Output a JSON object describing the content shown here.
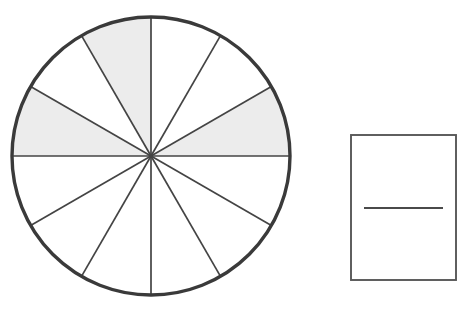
{
  "diagram": {
    "background_color": "#ffffff"
  },
  "chart_data": {
    "type": "pie",
    "title": "",
    "subtitle": "",
    "xlabel": "",
    "ylabel": "",
    "legend_position": "none",
    "grid": false,
    "total_sectors": 12,
    "sector_angle_degrees": 30,
    "shaded_count": 3,
    "unshaded_count": 9,
    "fraction_shaded": "3/12",
    "categories": [
      "0-30",
      "30-60",
      "60-90",
      "90-120",
      "120-150",
      "150-180",
      "180-210",
      "210-240",
      "240-270",
      "270-300",
      "300-330",
      "330-360"
    ],
    "values": [
      30,
      30,
      30,
      30,
      30,
      30,
      30,
      30,
      30,
      30,
      30,
      30
    ],
    "series": [
      {
        "name": "shaded",
        "values": [
          1,
          0,
          0,
          1,
          0,
          1,
          0,
          0,
          0,
          0,
          0,
          0
        ]
      }
    ],
    "shaded_sectors": [
      {
        "index": 0,
        "start_deg": 0,
        "end_deg": 30,
        "shaded": true
      },
      {
        "index": 1,
        "start_deg": 30,
        "end_deg": 60,
        "shaded": false
      },
      {
        "index": 2,
        "start_deg": 60,
        "end_deg": 90,
        "shaded": false
      },
      {
        "index": 3,
        "start_deg": 90,
        "end_deg": 120,
        "shaded": true
      },
      {
        "index": 4,
        "start_deg": 120,
        "end_deg": 150,
        "shaded": false
      },
      {
        "index": 5,
        "start_deg": 150,
        "end_deg": 180,
        "shaded": true
      },
      {
        "index": 6,
        "start_deg": 180,
        "end_deg": 210,
        "shaded": false
      },
      {
        "index": 7,
        "start_deg": 210,
        "end_deg": 240,
        "shaded": false
      },
      {
        "index": 8,
        "start_deg": 240,
        "end_deg": 270,
        "shaded": false
      },
      {
        "index": 9,
        "start_deg": 270,
        "end_deg": 300,
        "shaded": false
      },
      {
        "index": 10,
        "start_deg": 300,
        "end_deg": 330,
        "shaded": false
      },
      {
        "index": 11,
        "start_deg": 330,
        "end_deg": 360,
        "shaded": false
      }
    ]
  },
  "colors": {
    "shaded_fill": "#ececec",
    "unshaded_fill": "#ffffff",
    "circle_outline": "#3a3a3a",
    "spoke_line": "#444444",
    "box_outline": "#585858",
    "box_divider": "#4a4a4a"
  },
  "geometry": {
    "circle": {
      "center_x": 151,
      "center_y": 156,
      "radius": 139,
      "outline_width": 3.4
    },
    "box": {
      "x": 351,
      "y": 135,
      "width": 105,
      "height": 145,
      "divider_y": 208,
      "divider_x_start": 364,
      "divider_x_end": 443
    }
  }
}
